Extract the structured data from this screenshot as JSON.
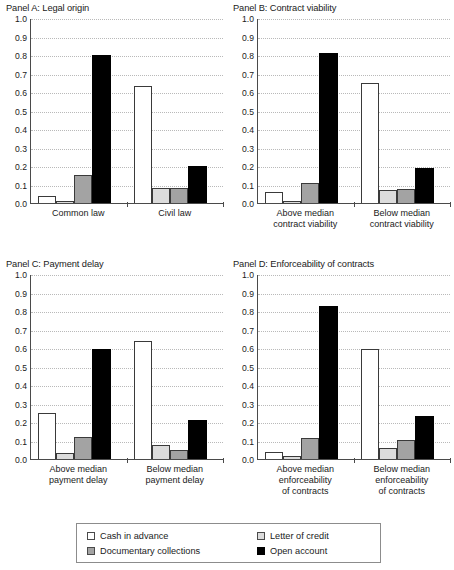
{
  "chart_data": {
    "type": "bar",
    "title": "",
    "series_names": [
      "Cash in advance",
      "Letter of credit",
      "Documentary collections",
      "Open account"
    ],
    "series_colors": [
      "#ffffff",
      "#dcdcdc",
      "#a3a3a3",
      "#000000"
    ],
    "ylim": [
      0.0,
      1.0
    ],
    "ytick_labels": [
      "1.0",
      "0.9",
      "0.8",
      "0.7",
      "0.6",
      "0.5",
      "0.4",
      "0.3",
      "0.2",
      "0.1",
      "0.0"
    ],
    "ytick_values": [
      1.0,
      0.9,
      0.8,
      0.7,
      0.6,
      0.5,
      0.4,
      0.3,
      0.2,
      0.1,
      0.0
    ],
    "grid": true,
    "legend_position": "bottom",
    "xlabel": "",
    "ylabel": "",
    "panels": [
      {
        "title": "Panel A: Legal origin",
        "categories": [
          "Common law",
          "Civil law"
        ],
        "category_lines": [
          [
            "Common law"
          ],
          [
            "Civil law"
          ]
        ],
        "series": [
          {
            "name": "Cash in advance",
            "values": [
              0.04,
              0.63
            ]
          },
          {
            "name": "Letter of credit",
            "values": [
              0.01,
              0.08
            ]
          },
          {
            "name": "Documentary collections",
            "values": [
              0.15,
              0.08
            ]
          },
          {
            "name": "Open account",
            "values": [
              0.8,
              0.2
            ]
          }
        ]
      },
      {
        "title": "Panel B: Contract viability",
        "categories": [
          "Above median contract viability",
          "Below median contract viability"
        ],
        "category_lines": [
          [
            "Above median",
            "contract viability"
          ],
          [
            "Below median",
            "contract viability"
          ]
        ],
        "series": [
          {
            "name": "Cash in advance",
            "values": [
              0.06,
              0.65
            ]
          },
          {
            "name": "Letter of credit",
            "values": [
              0.01,
              0.07
            ]
          },
          {
            "name": "Documentary collections",
            "values": [
              0.11,
              0.075
            ]
          },
          {
            "name": "Open account",
            "values": [
              0.81,
              0.19
            ]
          }
        ]
      },
      {
        "title": "Panel C: Payment delay",
        "categories": [
          "Above median payment delay",
          "Below median payment delay"
        ],
        "category_lines": [
          [
            "Above median",
            "payment delay"
          ],
          [
            "Below median",
            "payment delay"
          ]
        ],
        "series": [
          {
            "name": "Cash in advance",
            "values": [
              0.25,
              0.64
            ]
          },
          {
            "name": "Letter of credit",
            "values": [
              0.03,
              0.075
            ]
          },
          {
            "name": "Documentary collections",
            "values": [
              0.12,
              0.05
            ]
          },
          {
            "name": "Open account",
            "values": [
              0.595,
              0.21
            ]
          }
        ]
      },
      {
        "title": "Panel D: Enforceability of contracts",
        "categories": [
          "Above median enforceability of contracts",
          "Below median enforceability of contracts"
        ],
        "category_lines": [
          [
            "Above median",
            "enforceability",
            "of contracts"
          ],
          [
            "Below median",
            "enforceability",
            "of contracts"
          ]
        ],
        "series": [
          {
            "name": "Cash in advance",
            "values": [
              0.04,
              0.595
            ]
          },
          {
            "name": "Letter of credit",
            "values": [
              0.015,
              0.06
            ]
          },
          {
            "name": "Documentary collections",
            "values": [
              0.115,
              0.105
            ]
          },
          {
            "name": "Open account",
            "values": [
              0.825,
              0.23
            ]
          }
        ]
      }
    ]
  },
  "legend": {
    "items": [
      {
        "label": "Cash in advance",
        "color": "#ffffff"
      },
      {
        "label": "Letter of credit",
        "color": "#dcdcdc"
      },
      {
        "label": "Documentary collections",
        "color": "#a3a3a3"
      },
      {
        "label": "Open account",
        "color": "#000000"
      }
    ]
  }
}
